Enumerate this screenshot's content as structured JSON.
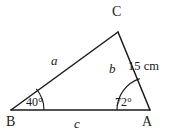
{
  "figure": {
    "type": "triangle-diagram",
    "background_color": "#ffffff",
    "stroke_color": "#1a1a1a",
    "vertices": {
      "A": {
        "label": "A",
        "x": 150,
        "y": 110
      },
      "B": {
        "label": "B",
        "x": 11,
        "y": 110
      },
      "C": {
        "label": "C",
        "x": 118,
        "y": 32
      }
    },
    "sides": [
      {
        "name": "side-a",
        "label": "a",
        "from": "B",
        "to": "C",
        "label_x": 51,
        "label_y": 54
      },
      {
        "name": "side-b",
        "label": "b",
        "from": "C",
        "to": "A",
        "label_x": 109,
        "label_y": 62
      },
      {
        "name": "side-c",
        "label": "c",
        "from": "B",
        "to": "A",
        "label_x": 74,
        "label_y": 117
      }
    ],
    "angles": [
      {
        "name": "angle-B",
        "label": "40°",
        "value": 40,
        "vertex": "B",
        "arc_radius": 33
      },
      {
        "name": "angle-A",
        "label": "72°",
        "value": 72,
        "vertex": "A",
        "arc_radius": 33
      }
    ],
    "measurements": [
      {
        "name": "side-b-measure",
        "label": "15 cm",
        "value": 15,
        "unit": "cm",
        "applies_to": "b"
      }
    ]
  }
}
